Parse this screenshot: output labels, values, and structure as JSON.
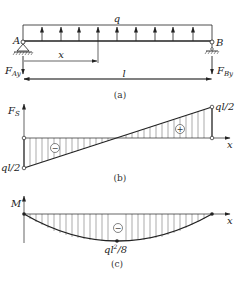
{
  "panel_a": {
    "load_label": "q",
    "support_a_label": "A",
    "support_b_label": "B",
    "position_label": "x",
    "length_label": "l",
    "reaction_a": {
      "main": "F",
      "sub": "Ay"
    },
    "reaction_b": {
      "main": "F",
      "sub": "By"
    },
    "caption": "(a)",
    "load_direction": "upward",
    "load_arrow_count": 9
  },
  "panel_b": {
    "y_axis": {
      "main": "F",
      "sub": "S"
    },
    "x_axis": "x",
    "left_value": "ql/2",
    "right_value": "ql/2",
    "left_sign": "−",
    "right_sign": "+",
    "caption": "(b)"
  },
  "panel_c": {
    "y_axis": "M",
    "x_axis": "x",
    "min_value": {
      "base": "ql",
      "exp": "2",
      "rest": "/8"
    },
    "sign": "−",
    "caption": "(c)"
  },
  "colors": {
    "line": "#222222",
    "hatch": "#555555",
    "background": "#ffffff"
  }
}
